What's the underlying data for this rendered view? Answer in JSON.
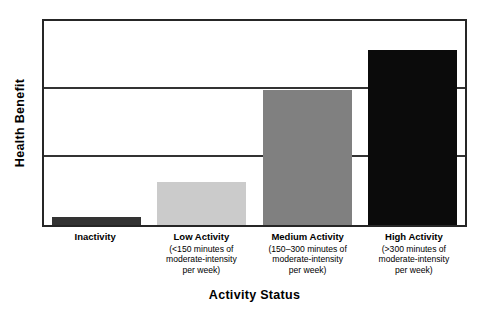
{
  "chart_data": {
    "type": "bar",
    "title": "",
    "xlabel": "Activity Status",
    "ylabel": "Health Benefit",
    "categories": [
      "Inactivity",
      "Low Activity",
      "Medium Activity",
      "High Activity"
    ],
    "category_details": [
      "",
      "(<150 minutes of moderate-intensity per week)",
      "(150–300 minutes of moderate-intensity per week)",
      "(>300 minutes of moderate-intensity per week)"
    ],
    "values": [
      4,
      21,
      66,
      86
    ],
    "ylim": [
      0,
      100
    ],
    "yticks": [],
    "ytick_labels": [],
    "grid": true,
    "gridlines_y": [
      33.3,
      66.7
    ],
    "legend": "none",
    "bar_colors": [
      "#333333",
      "#CBCBCB",
      "#808080",
      "#0B0B0B"
    ]
  },
  "axes": {
    "y_title": "Health Benefit",
    "x_title": "Activity Status",
    "frame_color": "#262626",
    "grid_color": "#333333"
  },
  "bars": [
    {
      "label": "Inactivity",
      "sub_lines": [],
      "value": 4,
      "color": "#333333"
    },
    {
      "label": "Low Activity",
      "sub_lines": [
        "(<150 minutes of",
        "moderate-intensity",
        "per week)"
      ],
      "value": 21,
      "color": "#CBCBCB"
    },
    {
      "label": "Medium Activity",
      "sub_lines": [
        "(150–300 minutes of",
        "moderate-intensity",
        "per week)"
      ],
      "value": 66,
      "color": "#808080"
    },
    {
      "label": "High Activity",
      "sub_lines": [
        "(>300 minutes of",
        "moderate-intensity",
        "per week)"
      ],
      "value": 86,
      "color": "#0B0B0B"
    }
  ]
}
